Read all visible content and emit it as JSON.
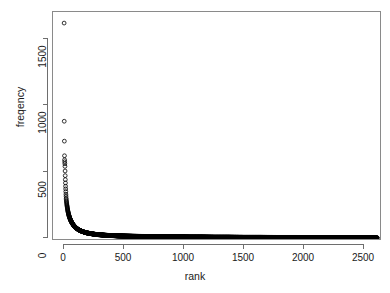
{
  "chart_data": {
    "type": "scatter",
    "title": "",
    "subtitle": "",
    "xlabel": "rank",
    "ylabel": "freqency",
    "grid": false,
    "legend": null,
    "marker": "open-circle",
    "marker_color": "#000000",
    "marker_size_px": 4,
    "xlim": [
      -40,
      2700
    ],
    "ylim": [
      -60,
      1690
    ],
    "xticks": [
      0,
      500,
      1000,
      1500,
      2000,
      2500
    ],
    "yticks": [
      0,
      500,
      1000,
      1500
    ],
    "xtick_labels": [
      "0",
      "500",
      "1000",
      "1500",
      "2000",
      "2500"
    ],
    "ytick_labels": [
      "0",
      "500",
      "1000",
      "1500"
    ],
    "n_points": 2610,
    "x": [
      1,
      2,
      3,
      4,
      5,
      6,
      7,
      8,
      9,
      10,
      11,
      12,
      13,
      14,
      15,
      16,
      17,
      18,
      19,
      20,
      22,
      24,
      26,
      28,
      30,
      33,
      36,
      39,
      42,
      46,
      50,
      55,
      60,
      66,
      72,
      79,
      86,
      94,
      103,
      112,
      122,
      133,
      145,
      158,
      172,
      188,
      205,
      223,
      243,
      265,
      289,
      315,
      343,
      374,
      408,
      445,
      485,
      529,
      577,
      629,
      686,
      748,
      815,
      889,
      969,
      1056,
      1151,
      1255,
      1368,
      1491,
      1625,
      1771,
      1930,
      2104,
      2293,
      2450,
      2550,
      2610
    ],
    "y": [
      1620,
      880,
      730,
      620,
      590,
      575,
      560,
      540,
      505,
      470,
      440,
      415,
      390,
      370,
      350,
      330,
      315,
      300,
      290,
      280,
      265,
      250,
      238,
      226,
      215,
      200,
      188,
      177,
      167,
      156,
      146,
      135,
      125,
      115,
      106,
      97,
      89,
      81,
      74,
      68,
      62,
      57,
      52,
      47,
      43,
      39,
      36,
      33,
      30,
      27,
      25,
      23,
      21,
      19,
      18,
      16,
      15,
      14,
      13,
      12,
      11,
      10,
      9,
      9,
      8,
      7,
      7,
      6,
      6,
      5,
      5,
      4,
      4,
      3,
      3,
      2,
      2,
      1
    ]
  },
  "axis": {
    "y_title": "freqency",
    "x_title": "rank",
    "y_tick_labels": [
      "1500",
      "1000",
      "500",
      "0"
    ],
    "x_tick_labels": [
      "0",
      "500",
      "1000",
      "1500",
      "2000",
      "2500"
    ]
  },
  "colors": {
    "background": "#ffffff",
    "axis": "#6e6e6e",
    "frame": "#8a8a8a",
    "text": "#1a1a1a",
    "point": "#000000"
  }
}
